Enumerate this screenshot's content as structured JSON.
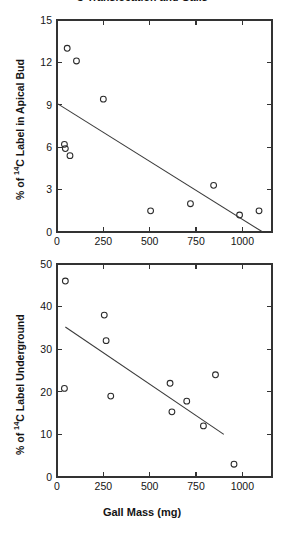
{
  "figure": {
    "title": "C Translocation and Galls",
    "title_visible_fragment": "C Translocation and Galls"
  },
  "chart_data": [
    {
      "panel": "top",
      "type": "scatter",
      "title": "",
      "xlabel": "",
      "ylabel": "% of 14C Label in Apical Bud",
      "ylabel_parts": {
        "pre": "% of ",
        "sup": "14",
        "post": "C Label in Apical Bud"
      },
      "xlim": [
        0,
        1160
      ],
      "ylim": [
        0,
        15
      ],
      "xticks": [
        0,
        250,
        500,
        750,
        1000
      ],
      "xticklabels": [
        "0",
        "250",
        "500",
        "750",
        "1000"
      ],
      "yticks": [
        0,
        3,
        6,
        9,
        12,
        15
      ],
      "yticklabels": [
        "0",
        "3",
        "6",
        "9",
        "12",
        "15"
      ],
      "grid": false,
      "legend": false,
      "marker": "open-circle",
      "points": [
        {
          "x": 55,
          "y": 13.0
        },
        {
          "x": 40,
          "y": 6.2
        },
        {
          "x": 45,
          "y": 5.9
        },
        {
          "x": 70,
          "y": 5.4
        },
        {
          "x": 105,
          "y": 12.1
        },
        {
          "x": 250,
          "y": 9.4
        },
        {
          "x": 505,
          "y": 1.5
        },
        {
          "x": 720,
          "y": 2.0
        },
        {
          "x": 845,
          "y": 3.3
        },
        {
          "x": 985,
          "y": 1.2
        },
        {
          "x": 1090,
          "y": 1.5
        }
      ],
      "fit_line": {
        "x0": 0,
        "y0": 9.1,
        "x1": 1110,
        "y1": 0.0
      }
    },
    {
      "panel": "bottom",
      "type": "scatter",
      "title": "",
      "xlabel": "Gall Mass (mg)",
      "ylabel": "% of 14C Label Underground",
      "ylabel_parts": {
        "pre": "% of ",
        "sup": "14",
        "post": "C Label Underground"
      },
      "xlim": [
        0,
        1160
      ],
      "ylim": [
        0,
        50
      ],
      "xticks": [
        0,
        250,
        500,
        750,
        1000
      ],
      "xticklabels": [
        "0",
        "250",
        "500",
        "750",
        "1000"
      ],
      "yticks": [
        0,
        10,
        20,
        30,
        40,
        50
      ],
      "yticklabels": [
        "0",
        "10",
        "20",
        "30",
        "40",
        "50"
      ],
      "grid": false,
      "legend": false,
      "marker": "open-circle",
      "points": [
        {
          "x": 45,
          "y": 46.0
        },
        {
          "x": 40,
          "y": 20.8
        },
        {
          "x": 255,
          "y": 38.0
        },
        {
          "x": 265,
          "y": 32.0
        },
        {
          "x": 290,
          "y": 19.0
        },
        {
          "x": 610,
          "y": 22.0
        },
        {
          "x": 620,
          "y": 15.3
        },
        {
          "x": 700,
          "y": 17.8
        },
        {
          "x": 790,
          "y": 12.0
        },
        {
          "x": 855,
          "y": 24.0
        },
        {
          "x": 955,
          "y": 3.0
        }
      ],
      "fit_line": {
        "x0": 45,
        "y0": 35.2,
        "x1": 900,
        "y1": 10.0
      }
    }
  ]
}
